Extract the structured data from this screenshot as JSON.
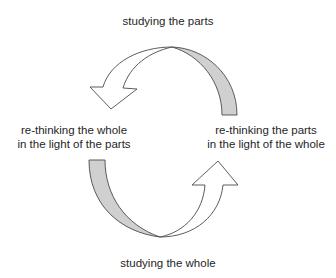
{
  "diagram": {
    "type": "cycle",
    "labels": {
      "top": "studying the parts",
      "bottom": "studying the whole",
      "left_line1": "re-thinking the whole",
      "left_line2": "in the light of the parts",
      "right_line1": "re-thinking the parts",
      "right_line2": "in the light of the whole"
    },
    "arrows": [
      {
        "from": "re-thinking the parts in the light of the whole",
        "to": "re-thinking the whole in the light of the parts",
        "via": "studying the parts",
        "position": "top"
      },
      {
        "from": "re-thinking the whole in the light of the parts",
        "to": "re-thinking the parts in the light of the whole",
        "via": "studying the whole",
        "position": "bottom"
      }
    ],
    "colors": {
      "stroke": "#4a4a4a",
      "band_fill": "#d0d0d0",
      "arrow_fill": "#ffffff",
      "text": "#262626"
    }
  }
}
